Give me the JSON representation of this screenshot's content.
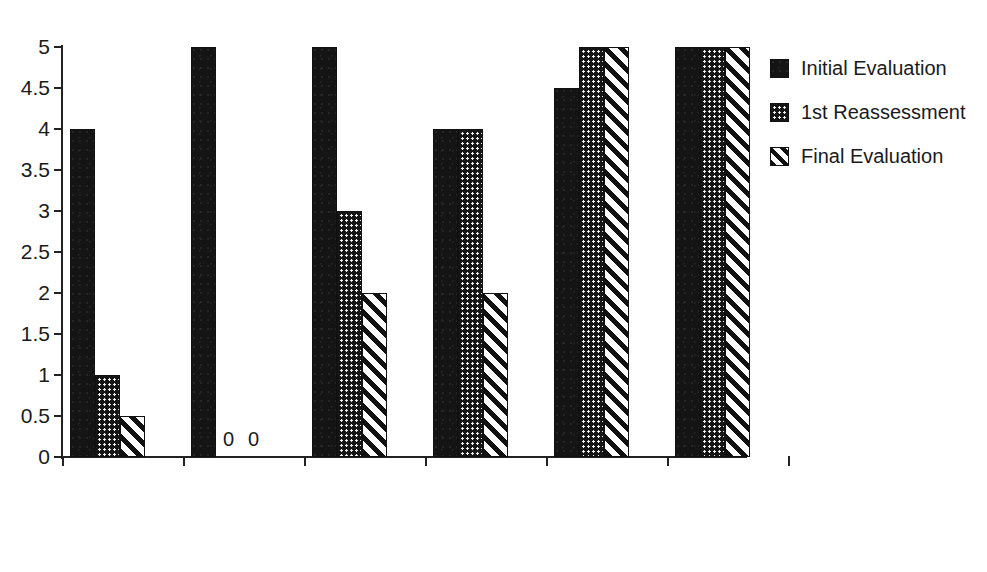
{
  "chart_data": {
    "type": "bar",
    "title": "",
    "xlabel": "",
    "ylabel": "",
    "ylim": [
      0,
      5
    ],
    "grid": false,
    "legend_position": "right",
    "y_ticks": [
      "0",
      "0.5",
      "1",
      "1.5",
      "2",
      "2.5",
      "3",
      "3.5",
      "4",
      "4.5",
      "5"
    ],
    "y_tick_values": [
      0,
      0.5,
      1,
      1.5,
      2,
      2.5,
      3,
      3.5,
      4,
      4.5,
      5
    ],
    "categories": [
      "Pain level",
      "Knee\nextension",
      "Difficulty\nin/out of\ncar",
      "Difficulty\nwith bathtub\nand stairs",
      "Muscle\nstrength",
      "Standing\ncalcaneal\ninversion"
    ],
    "series": [
      {
        "name": "Initial Evaluation",
        "pattern": "solid",
        "values": [
          4,
          5,
          5,
          4,
          4.5,
          5
        ]
      },
      {
        "name": "1st Reassessment",
        "pattern": "dotted",
        "values": [
          1,
          0,
          3,
          4,
          5,
          5
        ]
      },
      {
        "name": "Final Evaluation",
        "pattern": "hatch",
        "values": [
          0.5,
          0,
          2,
          2,
          5,
          5
        ]
      }
    ],
    "annotations": [
      {
        "text": "0",
        "category_index": 1,
        "series_index": 1
      },
      {
        "text": "0",
        "category_index": 1,
        "series_index": 2
      }
    ],
    "colors": {
      "ink": "#1a1a1a",
      "bar_outline": "#111111",
      "solid_fill": "#141414",
      "dotted_fill": "#161616",
      "hatch_fill": "#ffffff",
      "background": "#ffffff"
    }
  }
}
